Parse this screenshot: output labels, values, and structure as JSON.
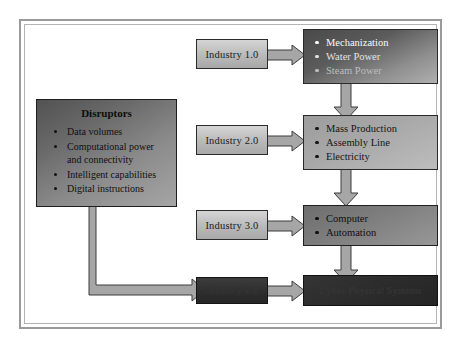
{
  "diagram": {
    "title_present": false,
    "frame": {
      "border_color": "#9a9a9a"
    },
    "disruptors": {
      "title": "Disruptors",
      "items": [
        "Data volumes",
        "Computational power and connectivity",
        "Intelligent capabilities",
        "Digital instructions"
      ]
    },
    "stages": [
      {
        "label": "Industry 1.0",
        "features": [
          "Mechanization",
          "Water Power",
          "Steam Power"
        ],
        "tone": "tone1"
      },
      {
        "label": "Industry 2.0",
        "features": [
          "Mass Production",
          "Assembly Line",
          "Electricity"
        ],
        "tone": "tone2"
      },
      {
        "label": "Industry 3.0",
        "features": [
          "Computer",
          "Automation"
        ],
        "tone": "tone3"
      },
      {
        "label": "Industry 4.0",
        "features": [
          "Cyber-Physical Systems"
        ],
        "tone": "tone4"
      }
    ],
    "colors": {
      "frame": "#9a9a9a",
      "arrow_fill": "#a6a6a6",
      "arrow_stroke": "#3d3d3d",
      "box_border": "#2b2b2b"
    }
  }
}
